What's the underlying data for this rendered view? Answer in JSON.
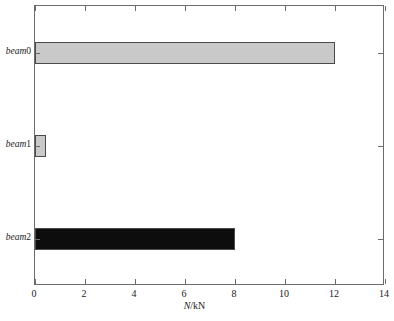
{
  "chart_data": {
    "type": "bar",
    "orientation": "horizontal",
    "title": "",
    "subtitle": "",
    "categories": [
      "beam0",
      "beam1",
      "beam2"
    ],
    "values": [
      12.0,
      0.45,
      8.0
    ],
    "series": [
      {
        "name": "N",
        "values": [
          12.0,
          0.45,
          8.0
        ]
      }
    ],
    "bar_colors": [
      "#c9c9c9",
      "#c9c9c9",
      "#0d0d0d"
    ],
    "bar_edge_color": "#4a4a4a",
    "xlabel": "N/kN",
    "xlabel_symbol": "N",
    "xlabel_unit": "/kN",
    "ylabel": "",
    "xlim": [
      0,
      14
    ],
    "xticks": [
      0,
      2,
      4,
      6,
      8,
      10,
      12,
      14
    ],
    "xtick_labels": [
      "0",
      "2",
      "4",
      "6",
      "8",
      "10",
      "12",
      "14"
    ],
    "ytick_labels": [
      "beam0",
      "beam1",
      "beam2"
    ],
    "grid": false,
    "legend": false,
    "legend_position": "none",
    "frame": true,
    "tick_direction": "in",
    "background_color": "#ffffff",
    "axis_color": "#6b6b6b"
  }
}
